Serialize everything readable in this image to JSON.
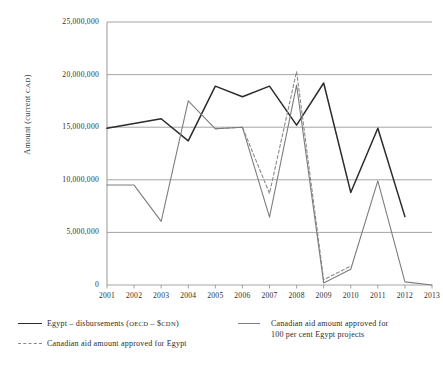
{
  "chart_data": {
    "type": "line",
    "title": "",
    "xlabel": "",
    "ylabel": "Amount (current CAD)",
    "ylabel_main": "Amount (current ",
    "ylabel_small": "CAD",
    "ylabel_close": ")",
    "grid": true,
    "legend_position": "bottom",
    "x": [
      2001,
      2002,
      2003,
      2004,
      2005,
      2006,
      2007,
      2008,
      2009,
      2010,
      2011,
      2012,
      2013
    ],
    "categories": [
      "2001",
      "2002",
      "2003",
      "2004",
      "2005",
      "2006",
      "2007",
      "2008",
      "2009",
      "2010",
      "2011",
      "2012",
      "2013"
    ],
    "ylim": [
      0,
      25000000
    ],
    "yticks": [
      0,
      5000000,
      10000000,
      15000000,
      20000000,
      25000000
    ],
    "ytick_labels": [
      "0",
      "5,000,000",
      "10,000,000",
      "15,000,000",
      "20,000,000",
      "25,000,000"
    ],
    "series": [
      {
        "name": "Egypt – disbursements (OECD – $CDN)",
        "style": "solid",
        "color": "#2b2b2b",
        "width": 1.5,
        "x": [
          2001,
          2002,
          2003,
          2004,
          2005,
          2006,
          2007,
          2008,
          2009,
          2010,
          2011,
          2012
        ],
        "values": [
          14900000,
          15350000,
          15800000,
          13700000,
          18900000,
          17900000,
          18900000,
          15200000,
          19200000,
          8800000,
          14900000,
          6500000
        ]
      },
      {
        "name": "Canadian aid amount approved for Egypt",
        "style": "dashed",
        "color": "#8a8a8a",
        "width": 1.1,
        "x": [
          2005,
          2006,
          2007,
          2008,
          2009,
          2010
        ],
        "values": [
          14850000,
          15000000,
          8700000,
          20300000,
          500000,
          1800000
        ]
      },
      {
        "name": "Canadian aid amount approved for 100 per cent Egypt projects",
        "style": "solid",
        "color": "#7d7d7d",
        "width": 1.1,
        "x": [
          2001,
          2002,
          2003,
          2004,
          2005,
          2006,
          2007,
          2008,
          2009,
          2010,
          2011,
          2012,
          2013
        ],
        "values": [
          9500000,
          9500000,
          6050000,
          17500000,
          14850000,
          15000000,
          6450000,
          19000000,
          200000,
          1500000,
          9900000,
          300000,
          0
        ]
      }
    ],
    "legend_entries": [
      {
        "label_main": "Egypt – disbursements (",
        "label_small": "OECD",
        "label_mid": " – $",
        "label_small2": "CDN",
        "label_end": ")",
        "style": "solid",
        "color": "#2b2b2b"
      },
      {
        "label_main": "Canadian aid amount approved for Egypt",
        "style": "dashed",
        "color": "#8a8a8a"
      },
      {
        "label_line1": "Canadian aid amount approved for",
        "label_line2": "100 per cent Egypt projects",
        "style": "solid",
        "color": "#7d7d7d"
      }
    ]
  }
}
